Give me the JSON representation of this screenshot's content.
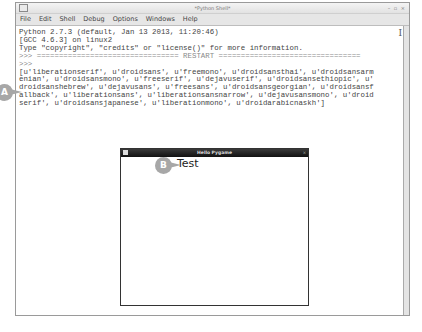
{
  "window": {
    "title": "*Python Shell*",
    "controls": "– ▫ ×"
  },
  "menubar": {
    "items": [
      "File",
      "Edit",
      "Shell",
      "Debug",
      "Options",
      "Windows",
      "Help"
    ]
  },
  "shell": {
    "lines": [
      "Python 2.7.3 (default, Jan 13 2013, 11:20:46)",
      "[GCC 4.6.3] on linux2",
      "Type \"copyright\", \"credits\" or \"license()\" for more information.",
      ">>> ================================ RESTART ================================",
      ">>> ",
      "[u'liberationserif', u'droidsans', u'freemono', u'droidsansthai', u'droidsansarm",
      "enian', u'droidsansmono', u'freeserif', u'dejavuserif', u'droidsansethiopic', u'",
      "droidsanshebrew', u'dejavusans', u'freesans', u'droidsansgeorgian', u'droidsansf",
      "allback', u'liberationsans', u'liberationsansnarrow', u'dejavusansmono', u'droid",
      "serif', u'droidsansjapanese', u'liberationmono', u'droidarabicnaskh']"
    ]
  },
  "callouts": {
    "a": "A",
    "b": "B"
  },
  "pygame_window": {
    "title": "Hello Pygame",
    "control": "×",
    "text": "Test"
  }
}
